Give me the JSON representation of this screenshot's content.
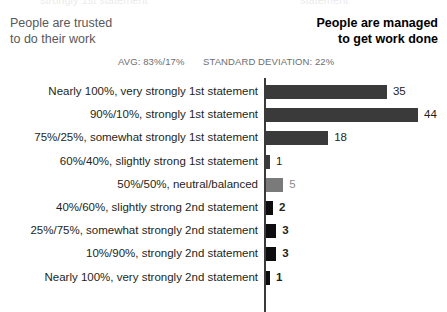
{
  "ghost": {
    "left_fragment": "strongly 1st statement",
    "right_fragment": "statement"
  },
  "header": {
    "left_title": "People are trusted\nto do their work",
    "left_line1": "People are trusted",
    "left_line2": "to do their work",
    "right_title": "People are managed\nto get work done",
    "right_line1": "People are managed",
    "right_line2": "to get work done"
  },
  "stats": {
    "avg_label": "AVG: 83%/17%",
    "stddev_label": "STANDARD DEVIATION: 22%"
  },
  "colors": {
    "first_statement_bar": "#3a3a3a",
    "neutral_bar": "#7a7a7a",
    "second_statement_bar": "#0d0d0d",
    "axis": "#3a3a3a",
    "label_text": "#231f20",
    "neutral_value_text": "#8c8c8c",
    "stat_text": "#6d6e71",
    "header_left_text": "#58595b",
    "header_right_text": "#000000"
  },
  "chart_data": {
    "type": "bar",
    "orientation": "horizontal",
    "xlabel": "",
    "ylabel": "",
    "xlim": [
      0,
      44
    ],
    "grid": false,
    "legend": false,
    "annotations": [
      "AVG: 83%/17%",
      "STANDARD DEVIATION: 22%"
    ],
    "categories": [
      "Nearly 100%, very strongly 1st statement",
      "90%/10%, strongly 1st statement",
      "75%/25%, somewhat strongly 1st statement",
      "60%/40%, slightly strong 1st statement",
      "50%/50%, neutral/balanced",
      "40%/60%, slightly strong 2nd statement",
      "25%/75%, somewhat strongly 2nd statement",
      "10%/90%, strongly 2nd statement",
      "Nearly 100%, very strongly 2nd statement"
    ],
    "values": [
      35,
      44,
      18,
      1,
      5,
      2,
      3,
      3,
      1
    ],
    "bar_groups": [
      "first",
      "first",
      "first",
      "first",
      "neutral",
      "second",
      "second",
      "second",
      "second"
    ],
    "value_labels": [
      "35",
      "44",
      "18",
      "1",
      "5",
      "2",
      "3",
      "3",
      "1"
    ]
  }
}
